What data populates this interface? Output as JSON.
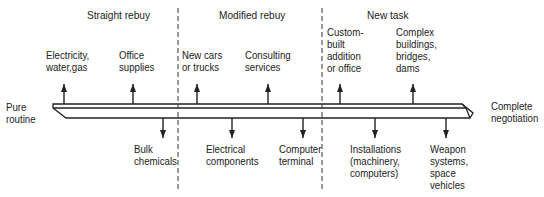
{
  "categories": [
    {
      "id": "straight-rebuy",
      "label": "Straight rebuy"
    },
    {
      "id": "modified-rebuy",
      "label": "Modified rebuy"
    },
    {
      "id": "new-task",
      "label": "New task"
    }
  ],
  "continuum": {
    "left_label": "Pure\nroutine",
    "right_label": "Complete\nnegotiation"
  },
  "items_above": [
    {
      "label": "Electricity,\nwater,gas",
      "direction": "up"
    },
    {
      "label": "Office\nsupplies",
      "direction": "up"
    },
    {
      "label": "New cars\nor trucks",
      "direction": "up"
    },
    {
      "label": "Consulting\nservices",
      "direction": "up"
    },
    {
      "label": "Custom-\nbuilt\naddition\nor office",
      "direction": "up"
    },
    {
      "label": "Complex\nbuildings,\nbridges,\ndams",
      "direction": "up"
    }
  ],
  "items_below": [
    {
      "label": "Bulk\nchemicals",
      "direction": "down"
    },
    {
      "label": "Electrical\ncomponents",
      "direction": "down"
    },
    {
      "label": "Computer\nterminal",
      "direction": "down"
    },
    {
      "label": "Installations\n(machinery,\ncomputers)",
      "direction": "down"
    },
    {
      "label": "Weapon\nsystems,\nspace\nvehicles",
      "direction": "down"
    }
  ],
  "colors": {
    "ink": "#222222",
    "background": "#ffffff"
  }
}
